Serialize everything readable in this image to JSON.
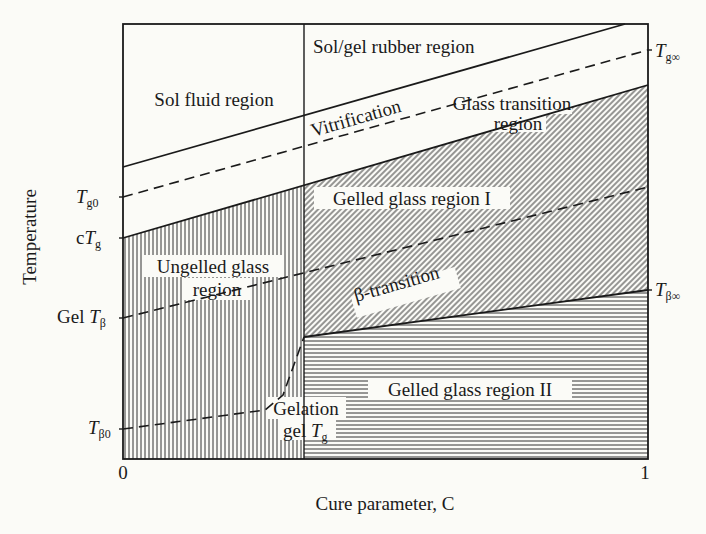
{
  "diagram": {
    "axes": {
      "ylabel": "Temperature",
      "xlabel": "Cure parameter, C",
      "x_ticks": [
        "0",
        "1"
      ]
    },
    "left_labels": {
      "tg0_main": "T",
      "tg0_sub": "g0",
      "ctg_prefix": "c",
      "ctg_main": "T",
      "ctg_sub": "g",
      "geltb_prefix": "Gel ",
      "geltb_main": "T",
      "geltb_sub": "β",
      "tb0_main": "T",
      "tb0_sub": "β0"
    },
    "right_labels": {
      "tginf_main": "T",
      "tginf_sub": "g∞",
      "tbinf_main": "T",
      "tbinf_sub": "β∞"
    },
    "regions": {
      "sol_fluid": "Sol fluid region",
      "sol_gel_rubber": "Sol/gel rubber region",
      "vitrification": "Vitrification",
      "glass_transition_1": "Glass transition",
      "glass_transition_2": "region",
      "gelled_glass_1": "Gelled glass region I",
      "ungelled_1": "Ungelled glass",
      "ungelled_2": "region",
      "beta_transition": "β-transition",
      "gelled_glass_2": "Gelled glass region II",
      "gelation_1": "Gelation",
      "gelation_2_prefix": "gel ",
      "gelation_2_main": "T",
      "gelation_2_sub": "g"
    },
    "colors": {
      "ink": "#1a1a1a",
      "paper": "#fbfbf7"
    }
  }
}
